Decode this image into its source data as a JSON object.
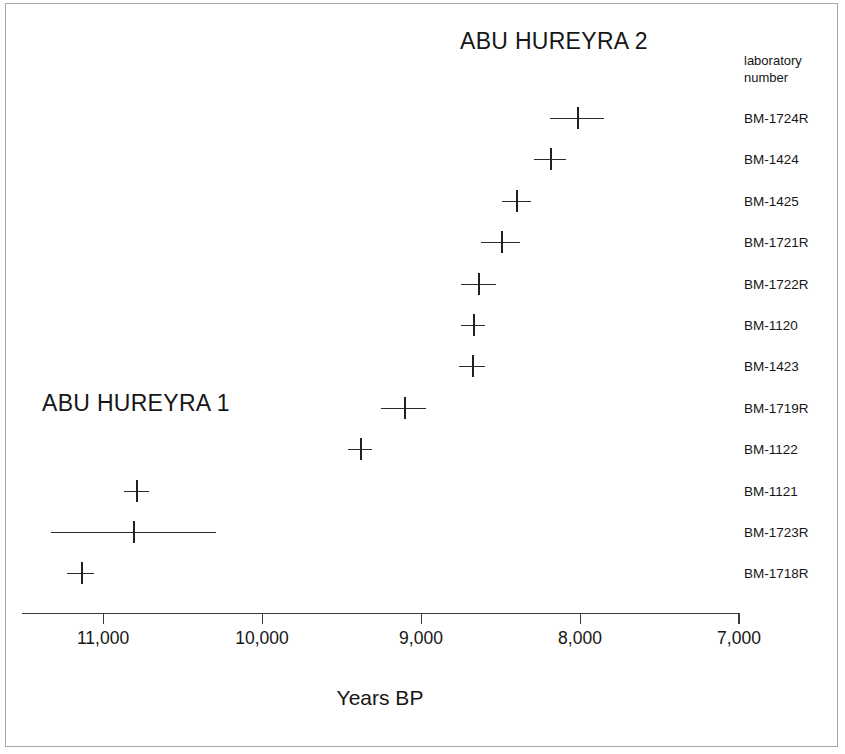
{
  "figure": {
    "phase_label_2": "ABU HUREYRA 2",
    "phase_label_1": "ABU HUREYRA 1",
    "column_header_line1": "laboratory",
    "column_header_line2": "number",
    "axis_title": "Years BP",
    "frame_color": "#a8a8a8",
    "marker_color": "#1f1f1f",
    "axis_color": "#3b3b3b"
  },
  "chart_data": {
    "type": "scatter",
    "title": "",
    "xlabel": "Years BP",
    "ylabel": "",
    "xlim": [
      11600,
      7000
    ],
    "x_reversed": true,
    "grid": false,
    "legend": "none",
    "annotations": [
      {
        "text": "ABU HUREYRA 2",
        "x": 8150,
        "y_index": -1
      },
      {
        "text": "ABU HUREYRA 1",
        "x": 10950,
        "y_index": 7.5
      }
    ],
    "xticks": [
      11000,
      10000,
      9000,
      8000,
      7000
    ],
    "xtick_labels": [
      "11,000",
      "10,000",
      "9,000",
      "8,000",
      "7,000"
    ],
    "category_label": "laboratory number",
    "categories": [
      "BM-1724R",
      "BM-1424",
      "BM-1425",
      "BM-1721R",
      "BM-1722R",
      "BM-1120",
      "BM-1423",
      "BM-1719R",
      "BM-1122",
      "BM-1121",
      "BM-1723R",
      "BM-1718R"
    ],
    "values": [
      8020,
      8190,
      8400,
      8500,
      8640,
      8675,
      8680,
      9110,
      9385,
      10790,
      10810,
      11140
    ],
    "errors": [
      170,
      100,
      90,
      120,
      110,
      75,
      80,
      140,
      75,
      80,
      520,
      85
    ],
    "points": [
      {
        "label": "BM-1724R",
        "value": 8020,
        "error": 170,
        "phase": "Abu Hureyra 2"
      },
      {
        "label": "BM-1424",
        "value": 8190,
        "error": 100,
        "phase": "Abu Hureyra 2"
      },
      {
        "label": "BM-1425",
        "value": 8400,
        "error": 90,
        "phase": "Abu Hureyra 2"
      },
      {
        "label": "BM-1721R",
        "value": 8500,
        "error": 120,
        "phase": "Abu Hureyra 2"
      },
      {
        "label": "BM-1722R",
        "value": 8640,
        "error": 110,
        "phase": "Abu Hureyra 2"
      },
      {
        "label": "BM-1120",
        "value": 8675,
        "error": 75,
        "phase": "Abu Hureyra 2"
      },
      {
        "label": "BM-1423",
        "value": 8680,
        "error": 80,
        "phase": "Abu Hureyra 2"
      },
      {
        "label": "BM-1719R",
        "value": 9110,
        "error": 140,
        "phase": "Abu Hureyra 2"
      },
      {
        "label": "BM-1122",
        "value": 9385,
        "error": 75,
        "phase": "Abu Hureyra 1"
      },
      {
        "label": "BM-1121",
        "value": 10790,
        "error": 80,
        "phase": "Abu Hureyra 1"
      },
      {
        "label": "BM-1723R",
        "value": 10810,
        "error": 520,
        "phase": "Abu Hureyra 1"
      },
      {
        "label": "BM-1718R",
        "value": 11140,
        "error": 85,
        "phase": "Abu Hureyra 1"
      }
    ]
  }
}
